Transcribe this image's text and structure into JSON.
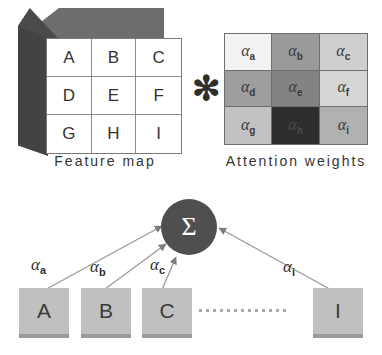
{
  "diagram": {
    "operator": {
      "symbol": "✻",
      "name": "elementwise-multiply"
    }
  },
  "feature_map": {
    "caption": "Feature map",
    "cells": [
      "A",
      "B",
      "C",
      "D",
      "E",
      "F",
      "G",
      "H",
      "I"
    ],
    "cube": {
      "top_face_color": "#6d6d6d",
      "left_face_color": "#4a4a4a",
      "front_face_color": "#ffffff"
    }
  },
  "attention_weights": {
    "caption": "Attention weights",
    "cells": [
      {
        "label": "α",
        "sub": "a",
        "color": "#f2f2f2",
        "text_color": "#3a3a3a"
      },
      {
        "label": "α",
        "sub": "b",
        "color": "#9a9a9a",
        "text_color": "#3a3a3a"
      },
      {
        "label": "α",
        "sub": "c",
        "color": "#cfcfcf",
        "text_color": "#3a3a3a"
      },
      {
        "label": "α",
        "sub": "d",
        "color": "#9e9e9e",
        "text_color": "#3a3a3a"
      },
      {
        "label": "α",
        "sub": "e",
        "color": "#838383",
        "text_color": "#3a3a3a"
      },
      {
        "label": "α",
        "sub": "f",
        "color": "#d6d6d6",
        "text_color": "#3a3a3a"
      },
      {
        "label": "α",
        "sub": "g",
        "color": "#c2c2c2",
        "text_color": "#3a3a3a"
      },
      {
        "label": "α",
        "sub": "h",
        "color": "#2e2e2e",
        "text_color": "#4a4a4a"
      },
      {
        "label": "α",
        "sub": "i",
        "color": "#b0b0b0",
        "text_color": "#3a3a3a"
      }
    ]
  },
  "aggregation": {
    "sum_node": {
      "symbol": "Σ",
      "color": "#4f4f4f",
      "text_color": "#ffffff"
    },
    "tokens": [
      {
        "label": "A",
        "weight_label": "α",
        "weight_sub": "a"
      },
      {
        "label": "B",
        "weight_label": "α",
        "weight_sub": "b"
      },
      {
        "label": "C",
        "weight_label": "α",
        "weight_sub": "c"
      },
      {
        "label": "I",
        "weight_label": "α",
        "weight_sub": "i"
      }
    ],
    "ellipsis_dot_count": 13,
    "box_color": "#c0c0c0",
    "arrow_color": "#8f8f8f"
  }
}
